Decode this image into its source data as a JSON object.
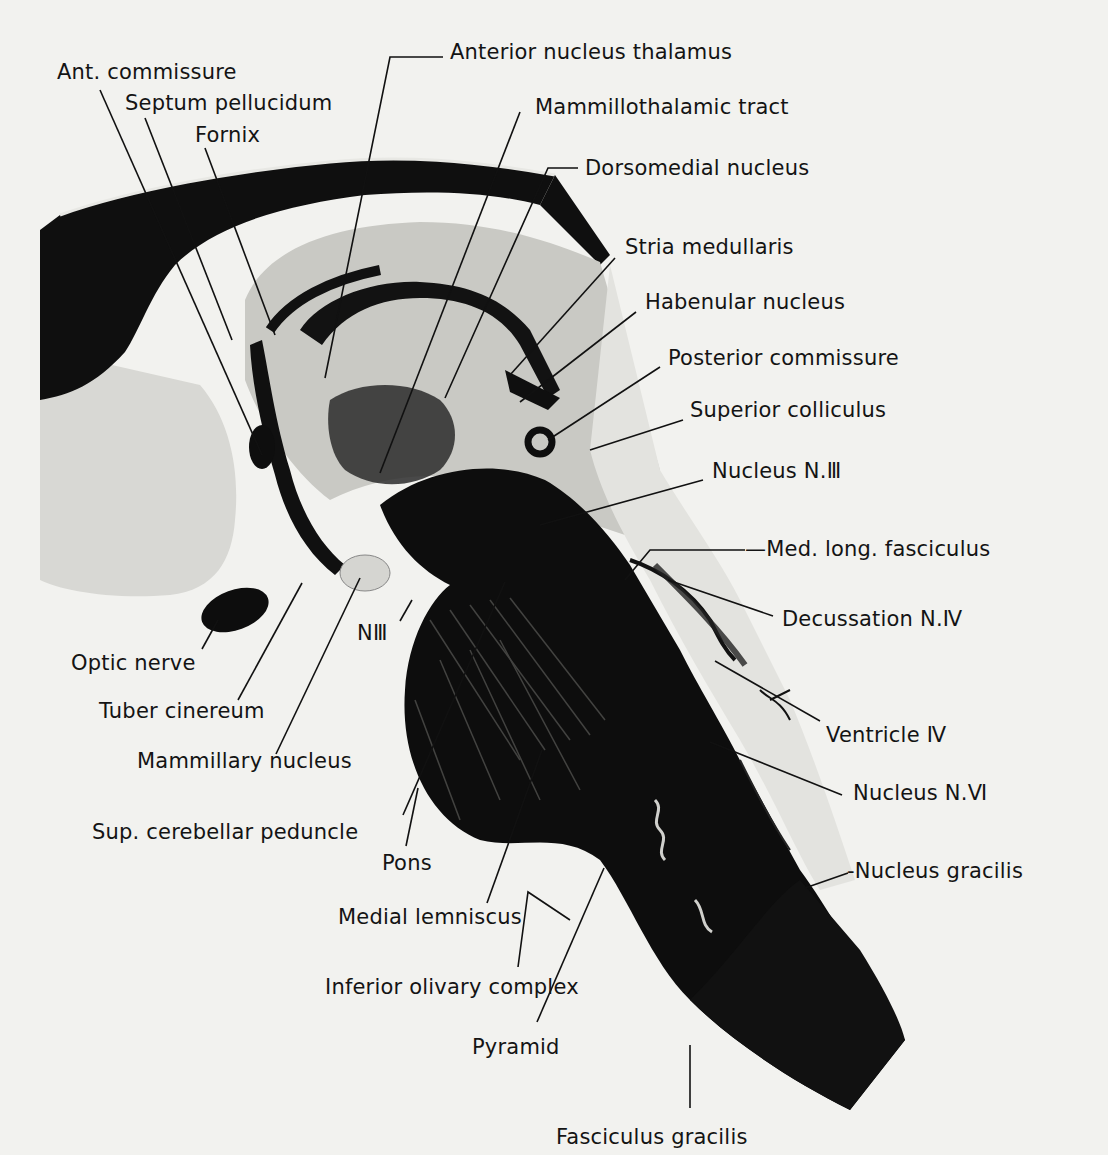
{
  "figure": {
    "type": "anatomical-section",
    "colors": {
      "paper": "#f2f2ef",
      "ink": "#111111",
      "tissue_light": "#dcdcd8",
      "tissue_mid": "#bdbdb8",
      "tissue_dark": "#0e0e0e"
    }
  },
  "labels": [
    {
      "id": "ant-commissure",
      "text": "Ant. commissure",
      "x": 57,
      "y": 62,
      "line": [
        [
          100,
          90
        ],
        [
          262,
          455
        ]
      ]
    },
    {
      "id": "septum-pellucidum",
      "text": "Septum pellucidum",
      "x": 125,
      "y": 93,
      "line": [
        [
          145,
          118
        ],
        [
          232,
          340
        ]
      ]
    },
    {
      "id": "fornix",
      "text": "Fornix",
      "x": 195,
      "y": 125,
      "line": [
        [
          205,
          148
        ],
        [
          275,
          335
        ]
      ]
    },
    {
      "id": "anterior-nucleus-thalamus",
      "text": "Anterior nucleus thalamus",
      "x": 450,
      "y": 42,
      "line": [
        [
          443,
          57
        ],
        [
          390,
          57
        ],
        [
          325,
          378
        ]
      ]
    },
    {
      "id": "mammillothalamic-tract",
      "text": "Mammillothalamic tract",
      "x": 535,
      "y": 97,
      "line": [
        [
          520,
          112
        ],
        [
          380,
          473
        ]
      ]
    },
    {
      "id": "dorsomedial-nucleus",
      "text": "Dorsomedial nucleus",
      "x": 585,
      "y": 158,
      "line": [
        [
          578,
          168
        ],
        [
          548,
          168
        ],
        [
          445,
          398
        ]
      ]
    },
    {
      "id": "stria-medullaris",
      "text": "Stria medullaris",
      "x": 625,
      "y": 237,
      "line": [
        [
          615,
          258
        ],
        [
          510,
          375
        ]
      ]
    },
    {
      "id": "habenular-nucleus",
      "text": "Habenular nucleus",
      "x": 645,
      "y": 292,
      "line": [
        [
          636,
          312
        ],
        [
          520,
          402
        ]
      ]
    },
    {
      "id": "posterior-commissure",
      "text": "Posterior commissure",
      "x": 668,
      "y": 348,
      "line": [
        [
          660,
          367
        ],
        [
          548,
          440
        ]
      ]
    },
    {
      "id": "superior-colliculus",
      "text": "Superior colliculus",
      "x": 690,
      "y": 400,
      "line": [
        [
          683,
          420
        ],
        [
          590,
          450
        ]
      ]
    },
    {
      "id": "nucleus-n-iii",
      "text": "Nucleus N.Ⅲ",
      "x": 712,
      "y": 461,
      "line": [
        [
          703,
          480
        ],
        [
          540,
          525
        ]
      ]
    },
    {
      "id": "med-long-fasciculus",
      "text": "—Med. long. fasciculus",
      "x": 745,
      "y": 539,
      "line": [
        [
          745,
          550
        ],
        [
          650,
          550
        ],
        [
          625,
          580
        ]
      ]
    },
    {
      "id": "decussation-n-iv",
      "text": "Decussation N.Ⅳ",
      "x": 782,
      "y": 609,
      "line": [
        [
          773,
          616
        ],
        [
          668,
          580
        ]
      ]
    },
    {
      "id": "ventricle-iv",
      "text": "Ventricle Ⅳ",
      "x": 826,
      "y": 725,
      "line": [
        [
          820,
          721
        ],
        [
          715,
          661
        ]
      ]
    },
    {
      "id": "nucleus-n-vi",
      "text": "Nucleus N.Ⅵ",
      "x": 853,
      "y": 783,
      "line": [
        [
          842,
          795
        ],
        [
          710,
          742
        ]
      ]
    },
    {
      "id": "nucleus-gracilis",
      "text": "-Nucleus gracilis",
      "x": 847,
      "y": 861,
      "line": [
        [
          848,
          873
        ],
        [
          805,
          888
        ]
      ]
    },
    {
      "id": "fasciculus-gracilis",
      "text": "Fasciculus gracilis",
      "x": 556,
      "y": 1127,
      "line": [
        [
          690,
          1108
        ],
        [
          690,
          1045
        ]
      ]
    },
    {
      "id": "pyramid",
      "text": "Pyramid",
      "x": 472,
      "y": 1037,
      "line": [
        [
          537,
          1022
        ],
        [
          604,
          868
        ]
      ]
    },
    {
      "id": "inferior-olivary-complex",
      "text": "Inferior olivary complex",
      "x": 325,
      "y": 977,
      "line": [
        [
          518,
          967
        ],
        [
          528,
          892
        ],
        [
          570,
          920
        ]
      ]
    },
    {
      "id": "medial-lemniscus",
      "text": "Medial lemniscus",
      "x": 338,
      "y": 907,
      "line": [
        [
          487,
          903
        ],
        [
          542,
          750
        ]
      ]
    },
    {
      "id": "pons",
      "text": "Pons",
      "x": 382,
      "y": 853,
      "line": [
        [
          406,
          846
        ],
        [
          418,
          788
        ]
      ]
    },
    {
      "id": "sup-cerebellar-peduncle",
      "text": "Sup. cerebellar peduncle",
      "x": 92,
      "y": 822,
      "line": [
        [
          403,
          815
        ],
        [
          505,
          582
        ]
      ]
    },
    {
      "id": "mammillary-nucleus",
      "text": "Mammillary nucleus",
      "x": 137,
      "y": 751,
      "line": [
        [
          276,
          754
        ],
        [
          360,
          578
        ]
      ]
    },
    {
      "id": "tuber-cinereum",
      "text": "Tuber cinereum",
      "x": 99,
      "y": 701,
      "line": [
        [
          238,
          700
        ],
        [
          302,
          583
        ]
      ]
    },
    {
      "id": "optic-nerve",
      "text": "Optic nerve",
      "x": 71,
      "y": 653,
      "line": [
        [
          202,
          649
        ],
        [
          218,
          620
        ]
      ]
    },
    {
      "id": "n-iii",
      "text": "NⅢ",
      "x": 357,
      "y": 623,
      "line": [
        [
          400,
          621
        ],
        [
          412,
          600
        ]
      ]
    }
  ]
}
